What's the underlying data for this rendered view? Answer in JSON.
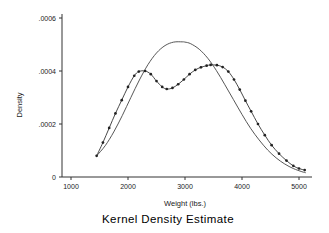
{
  "chart_data": {
    "type": "line",
    "title": "Kernel Density Estimate",
    "xlabel": "Weight (lbs.)",
    "ylabel": "Density",
    "xlim": [
      1250,
      5200
    ],
    "ylim": [
      0,
      0.00063
    ],
    "xticks": [
      1000,
      2000,
      3000,
      4000,
      5000
    ],
    "xticklabels": [
      "1000",
      "2000",
      "3000",
      "4000",
      "5000"
    ],
    "yticks": [
      0,
      0.0002,
      0.0004,
      0.0006
    ],
    "yticklabels": [
      "0",
      ".0002",
      ".0004",
      ".0006"
    ],
    "grid": false,
    "legend": "none",
    "series": [
      {
        "name": "kernel density (markers)",
        "style": "line-with-markers",
        "marker": "filled-circle",
        "color": "#333333",
        "x": [
          1450,
          1560,
          1670,
          1780,
          1890,
          2000,
          2110,
          2190,
          2300,
          2400,
          2500,
          2600,
          2680,
          2780,
          2880,
          2980,
          3080,
          3180,
          3280,
          3380,
          3450,
          3560,
          3660,
          3760,
          3860,
          3960,
          4060,
          4160,
          4280,
          4400,
          4520,
          4650,
          4780,
          4900,
          5000,
          5100
        ],
        "y": [
          8e-05,
          0.00013,
          0.000185,
          0.00024,
          0.00029,
          0.00034,
          0.000382,
          0.000398,
          0.0004,
          0.000388,
          0.000362,
          0.00034,
          0.000332,
          0.000336,
          0.00035,
          0.000368,
          0.000388,
          0.000404,
          0.000414,
          0.00042,
          0.000423,
          0.000422,
          0.000415,
          0.000398,
          0.000368,
          0.00033,
          0.000288,
          0.000248,
          0.0002,
          0.000158,
          0.00012,
          8.8e-05,
          6.2e-05,
          4.2e-05,
          3.2e-05,
          2.6e-05
        ]
      },
      {
        "name": "kernel density (smooth)",
        "style": "line",
        "marker": "none",
        "color": "#444444",
        "x": [
          1450,
          1600,
          1750,
          1900,
          2050,
          2200,
          2350,
          2500,
          2650,
          2800,
          2950,
          3000,
          3100,
          3250,
          3400,
          3550,
          3700,
          3850,
          4000,
          4150,
          4300,
          4450,
          4600,
          4750,
          4900,
          5050,
          5120
        ],
        "y": [
          8e-05,
          0.000118,
          0.00017,
          0.000232,
          0.0003,
          0.000366,
          0.000424,
          0.000468,
          0.000496,
          0.000509,
          0.00051,
          0.000509,
          0.000503,
          0.000482,
          0.000448,
          0.000402,
          0.000348,
          0.000292,
          0.000236,
          0.000184,
          0.00014,
          0.000102,
          7.2e-05,
          4.9e-05,
          3.2e-05,
          2e-05,
          1.6e-05
        ]
      }
    ]
  }
}
